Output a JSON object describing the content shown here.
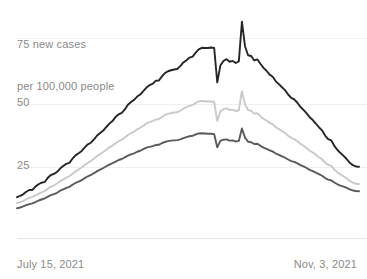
{
  "chart_data": {
    "type": "line",
    "title": "",
    "subtitle": "",
    "xlabel": "",
    "ylabel": "new cases per 100,000 people",
    "axis_caption_line1": "75 new cases",
    "axis_caption_line2": "per 100,000 people",
    "ytick_labels": [
      "75",
      "50",
      "25"
    ],
    "ytick_values": [
      75,
      50,
      25
    ],
    "ylim": [
      0,
      82
    ],
    "grid": true,
    "grid_axis": "y",
    "legend": "none",
    "x_start_label": "July 15, 2021",
    "x_end_label": "Nov, 3, 2021",
    "x_axis_type": "date",
    "x": [
      0,
      1,
      2,
      3,
      4,
      5,
      6,
      7,
      8,
      9,
      10,
      11,
      12,
      13,
      14,
      15,
      16,
      17,
      18,
      19,
      20,
      21,
      22,
      23,
      24,
      25,
      26,
      27,
      28,
      29,
      30,
      31,
      32,
      33,
      34,
      35,
      36,
      37,
      38,
      39,
      40,
      41,
      42,
      43,
      44,
      45,
      46,
      47,
      48,
      49,
      50,
      51,
      52,
      53,
      54,
      55,
      56,
      57,
      58,
      59,
      60,
      61,
      62,
      63,
      64,
      65,
      66,
      67,
      68,
      69,
      70,
      71,
      72,
      73,
      74,
      75,
      76,
      77,
      78,
      79,
      80,
      81,
      82,
      83,
      84,
      85,
      86,
      87,
      88,
      89,
      90,
      91,
      92,
      93,
      94,
      95,
      96,
      97,
      98,
      99,
      100,
      101,
      102,
      103,
      104,
      105,
      106,
      107,
      108,
      109,
      110,
      111
    ],
    "series": [
      {
        "name": "upper",
        "color": "#262626",
        "values": [
          13.5,
          14.0,
          14.6,
          15.6,
          16.3,
          16.3,
          17.6,
          18.5,
          19.1,
          19.4,
          21.0,
          22.1,
          22.5,
          23.3,
          24.6,
          25.6,
          26.4,
          26.8,
          28.4,
          29.7,
          30.5,
          31.4,
          32.8,
          34.0,
          34.6,
          35.9,
          37.4,
          38.4,
          39.3,
          40.7,
          42.0,
          43.0,
          44.6,
          45.6,
          46.2,
          47.5,
          49.3,
          50.4,
          51.2,
          52.5,
          53.3,
          54.6,
          56.0,
          56.9,
          57.4,
          58.6,
          58.7,
          60.2,
          61.6,
          62.3,
          62.7,
          63.0,
          63.2,
          64.3,
          65.7,
          66.6,
          67.6,
          68.0,
          69.5,
          70.8,
          71.4,
          71.3,
          71.3,
          71.5,
          71.3,
          58.0,
          64.5,
          66.3,
          67.0,
          66.0,
          66.3,
          65.5,
          66.1,
          81.5,
          72.0,
          68.5,
          68.2,
          66.5,
          66.9,
          65.2,
          63.6,
          62.5,
          61.0,
          60.2,
          58.4,
          57.3,
          56.1,
          55.0,
          53.3,
          52.0,
          51.4,
          50.1,
          48.5,
          47.3,
          46.0,
          44.5,
          43.4,
          42.0,
          40.6,
          39.4,
          37.4,
          36.0,
          35.5,
          33.4,
          31.8,
          30.6,
          29.5,
          28.3,
          26.8,
          25.9,
          25.4,
          25.3
        ]
      },
      {
        "name": "middle",
        "color": "#c9c9c9",
        "values": [
          11.2,
          11.6,
          12.0,
          12.7,
          13.2,
          13.6,
          14.2,
          14.9,
          15.4,
          15.9,
          16.8,
          17.6,
          18.1,
          18.8,
          19.7,
          20.4,
          21.1,
          21.6,
          22.6,
          23.5,
          24.2,
          25.0,
          26.0,
          26.8,
          27.5,
          28.4,
          29.5,
          30.2,
          31.0,
          31.9,
          32.8,
          33.5,
          34.4,
          35.2,
          35.8,
          36.6,
          37.6,
          38.3,
          38.9,
          39.8,
          40.4,
          41.2,
          42.1,
          42.6,
          43.0,
          43.6,
          43.7,
          44.6,
          45.4,
          45.8,
          46.1,
          46.3,
          46.4,
          47.0,
          47.8,
          48.4,
          48.9,
          49.2,
          50.0,
          50.6,
          50.8,
          50.7,
          50.6,
          50.6,
          50.4,
          43.0,
          46.8,
          47.6,
          47.9,
          47.3,
          47.4,
          46.9,
          47.2,
          54.6,
          49.5,
          47.3,
          47.0,
          45.9,
          46.0,
          44.9,
          43.9,
          43.2,
          42.3,
          41.7,
          40.6,
          39.9,
          39.1,
          38.4,
          37.3,
          36.5,
          36.0,
          35.2,
          34.2,
          33.4,
          32.5,
          31.5,
          30.8,
          29.9,
          29.0,
          28.2,
          26.9,
          26.0,
          25.6,
          24.2,
          23.1,
          22.3,
          21.6,
          20.8,
          19.8,
          19.1,
          18.7,
          18.6
        ]
      },
      {
        "name": "lower",
        "color": "#5a5a5a",
        "values": [
          9.2,
          9.5,
          9.9,
          10.4,
          10.8,
          11.1,
          11.6,
          12.2,
          12.6,
          13.0,
          13.7,
          14.3,
          14.7,
          15.2,
          16.0,
          16.5,
          17.1,
          17.5,
          18.3,
          19.0,
          19.5,
          20.1,
          20.9,
          21.6,
          22.1,
          22.8,
          23.6,
          24.2,
          24.8,
          25.5,
          26.1,
          26.7,
          27.3,
          27.9,
          28.3,
          28.9,
          29.6,
          30.1,
          30.5,
          31.1,
          31.5,
          32.1,
          32.7,
          33.0,
          33.3,
          33.7,
          33.8,
          34.4,
          34.9,
          35.2,
          35.4,
          35.5,
          35.6,
          35.9,
          36.4,
          36.8,
          37.1,
          37.3,
          37.8,
          38.2,
          38.3,
          38.2,
          38.1,
          38.1,
          37.9,
          32.8,
          35.3,
          35.8,
          35.9,
          35.4,
          35.5,
          35.1,
          35.3,
          40.1,
          36.6,
          35.0,
          34.8,
          34.1,
          34.2,
          33.4,
          32.7,
          32.2,
          31.6,
          31.2,
          30.4,
          29.9,
          29.3,
          28.8,
          28.1,
          27.5,
          27.2,
          26.6,
          25.9,
          25.4,
          24.8,
          24.1,
          23.6,
          23.0,
          22.4,
          21.8,
          20.9,
          20.3,
          20.0,
          19.2,
          18.5,
          18.0,
          17.6,
          17.1,
          16.5,
          16.1,
          15.9,
          15.8
        ]
      }
    ]
  },
  "colors": {
    "grid": "#efefef",
    "baseline": "#e4e4e4",
    "text": "#8a8a8a",
    "upper_line": "#262626",
    "middle_line": "#c9c9c9",
    "lower_line": "#5a5a5a"
  }
}
